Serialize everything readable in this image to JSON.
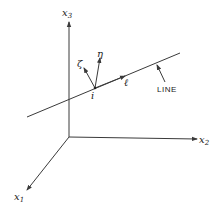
{
  "diagram": {
    "axes": {
      "x3": {
        "label": "x",
        "subscript": "3"
      },
      "x2": {
        "label": "x",
        "subscript": "2"
      },
      "x1": {
        "label": "x",
        "subscript": "1"
      }
    },
    "line_label": "LINE",
    "point_label": "i",
    "vectors": {
      "zeta": "ζ",
      "eta": "η",
      "ell": "ℓ"
    },
    "colors": {
      "stroke": "#3a3a3a",
      "background": "#ffffff"
    }
  }
}
